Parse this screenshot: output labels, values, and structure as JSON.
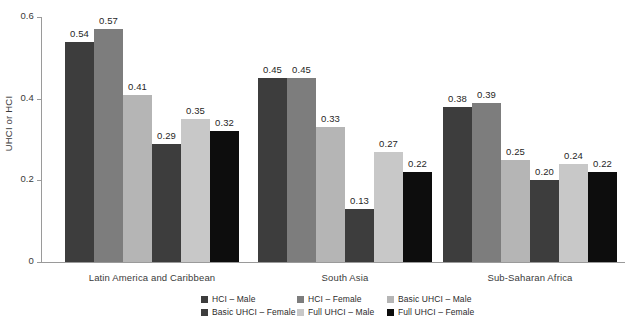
{
  "chart_data": {
    "type": "bar",
    "title": "",
    "xlabel": "",
    "ylabel": "UHCI or HCI",
    "ylim": [
      0,
      0.6
    ],
    "yticks": [
      "0",
      "0.2",
      "0.4",
      "0.6"
    ],
    "ytick_values": [
      0,
      0.2,
      0.4,
      0.6
    ],
    "grid": false,
    "legend_position": "bottom",
    "orientation": "vertical",
    "grouping": "grouped",
    "categories": [
      "Latin America and Caribbean",
      "South Asia",
      "Sub-Saharan Africa"
    ],
    "series": [
      {
        "name": "HCI – Male",
        "color": "#3d3d3d",
        "values": [
          0.54,
          0.45,
          0.38
        ],
        "labels": [
          "0.54",
          "0.45",
          "0.38"
        ]
      },
      {
        "name": "HCI – Female",
        "color": "#7d7d7d",
        "values": [
          0.57,
          0.45,
          0.39
        ],
        "labels": [
          "0.57",
          "0.45",
          "0.39"
        ]
      },
      {
        "name": "Basic UHCI – Male",
        "color": "#b5b5b5",
        "values": [
          0.41,
          0.33,
          0.25
        ],
        "labels": [
          "0.41",
          "0.33",
          "0.25"
        ]
      },
      {
        "name": "Basic UHCI – Female",
        "color": "#3d3d3d",
        "values": [
          0.29,
          0.13,
          0.2
        ],
        "labels": [
          "0.29",
          "0.13",
          "0.20"
        ]
      },
      {
        "name": "Full UHCI – Male",
        "color": "#c8c8c8",
        "values": [
          0.35,
          0.27,
          0.24
        ],
        "labels": [
          "0.35",
          "0.27",
          "0.24"
        ]
      },
      {
        "name": "Full UHCI – Female",
        "color": "#0d0d0d",
        "values": [
          0.32,
          0.22,
          0.22
        ],
        "labels": [
          "0.32",
          "0.22",
          "0.22"
        ]
      }
    ]
  },
  "axis": {
    "y_title": "UHCI or HCI"
  },
  "title_sliver": "",
  "colors": {
    "axis": "#9a9a9a",
    "text": "#3a3a3a",
    "value_text": "#1f1f1f",
    "background": "#ffffff"
  }
}
